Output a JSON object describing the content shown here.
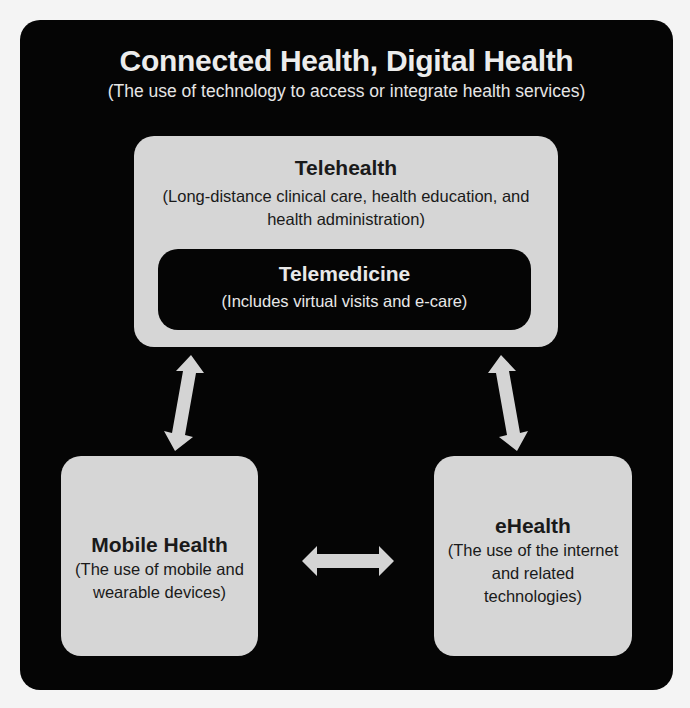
{
  "diagram": {
    "title": "Connected Health, Digital Health",
    "subtitle": "(The use of technology to access or integrate health services)",
    "nodes": {
      "telehealth": {
        "label": "Telehealth",
        "description": "(Long-distance clinical care, health education, and health administration)"
      },
      "telemedicine": {
        "label": "Telemedicine",
        "description": "(Includes virtual visits and e-care)"
      },
      "mobile_health": {
        "label": "Mobile Health",
        "description": "(The use of mobile and wearable devices)"
      },
      "ehealth": {
        "label": "eHealth",
        "description": "(The use of the internet and related technologies)"
      }
    },
    "edges": [
      {
        "from": "telehealth",
        "to": "mobile_health",
        "type": "bidirectional"
      },
      {
        "from": "telehealth",
        "to": "ehealth",
        "type": "bidirectional"
      },
      {
        "from": "mobile_health",
        "to": "ehealth",
        "type": "bidirectional"
      }
    ],
    "colors": {
      "frame": "#050505",
      "light_box": "#d6d6d6",
      "dark_text": "#1a1a1a",
      "light_text": "#ececec",
      "arrow": "#d4d4d4"
    }
  }
}
